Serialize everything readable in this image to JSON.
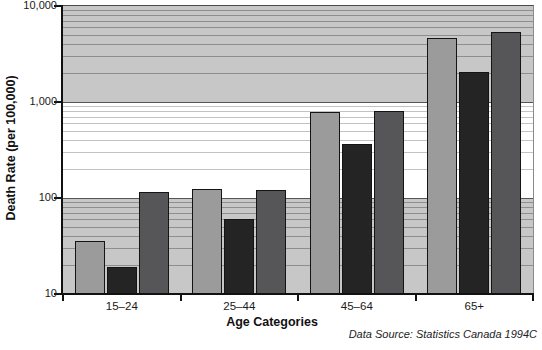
{
  "figure": {
    "y_axis_title": "Death Rate (per 100,000)",
    "x_axis_title": "Age Categories",
    "data_source": "Data Source: Statistics Canada 1994C"
  },
  "chart_data": {
    "type": "bar",
    "scale": "log",
    "title": "",
    "xlabel": "Age Categories",
    "ylabel": "Death Rate (per 100,000)",
    "categories": [
      "15–24",
      "25–44",
      "45–64",
      "65+"
    ],
    "series": [
      {
        "name": "light-gray-series",
        "color": "#9b9b9b",
        "values": [
          36,
          125,
          780,
          4600
        ]
      },
      {
        "name": "black-series",
        "color": "#242424",
        "values": [
          19,
          60,
          370,
          2050
        ]
      },
      {
        "name": "dark-gray-series",
        "color": "#565658",
        "values": [
          115,
          120,
          800,
          5400
        ]
      }
    ],
    "ylim": [
      10,
      10000
    ],
    "y_ticks": [
      10000,
      1000,
      100,
      10
    ],
    "y_tick_labels": [
      "10,000",
      "1,000",
      "100",
      "10"
    ],
    "grid": "log-minor-on",
    "legend": "none",
    "colors": {
      "band_gray": "#c7c7c7",
      "band_white": "#ffffff",
      "grid_on_gray": "#8e8e8e",
      "grid_on_white": "#c2c2c2",
      "grid_major": "#555555",
      "bar_outline": "#141414",
      "axis": "#111111"
    }
  }
}
